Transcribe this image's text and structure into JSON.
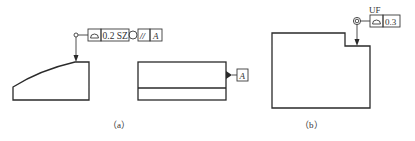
{
  "figure_a": {
    "caption": "（a）",
    "frame_1": {
      "symbol": "profile-of-surface",
      "tolerance": "0.2 SZ",
      "modifier": "circle",
      "relation_symbol": "//",
      "datum": "A"
    },
    "datum_label": "A"
  },
  "figure_b": {
    "caption": "（b）",
    "modifier_label": "UF",
    "frame": {
      "symbol": "profile-of-surface",
      "tolerance": "0.3"
    }
  }
}
